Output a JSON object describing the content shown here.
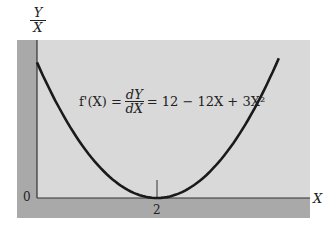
{
  "chart_data": {
    "type": "line",
    "title": "",
    "equation": {
      "lhs": "f'(X) =",
      "frac_num": "dY",
      "frac_den": "dX",
      "rhs": "= 12 − 12X + 3X²"
    },
    "ylabel": {
      "numerator": "Y",
      "denominator": "X"
    },
    "xlabel": "X",
    "origin_label": "0",
    "x_ticks": [
      {
        "value": 2,
        "label": "2"
      }
    ],
    "xlim": [
      0,
      4.3
    ],
    "ylim": [
      0,
      13
    ],
    "grid": false,
    "series": [
      {
        "name": "f'(X) = 12 - 12X + 3X^2",
        "x": [
          0,
          0.5,
          1,
          1.5,
          2,
          2.5,
          3,
          3.5,
          4
        ],
        "values": [
          12,
          6.75,
          3,
          0.75,
          0,
          0.75,
          3,
          6.75,
          12
        ]
      }
    ],
    "annotations": [
      {
        "type": "vertical-tick",
        "x": 2,
        "label": "minimum at X = 2"
      }
    ]
  }
}
